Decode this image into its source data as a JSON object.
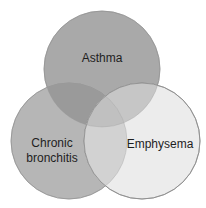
{
  "diagram": {
    "type": "venn",
    "sets": [
      {
        "id": "asthma",
        "label": "Asthma",
        "color": "#a9a9a9"
      },
      {
        "id": "chronic_bronchitis",
        "label_line1": "Chronic",
        "label_line2": "bronchitis",
        "color": "#b6b6b6"
      },
      {
        "id": "emphysema",
        "label": "Emphysema",
        "color": "#ececec"
      }
    ],
    "overlap_colors": {
      "asthma_chronic": "#9a9a9a",
      "asthma_emphysema": "#c6c6c6",
      "chronic_emphysema": "#d2d2d2",
      "all_three": "#c0c0c0"
    },
    "outline_color": "#8a8a8a"
  }
}
